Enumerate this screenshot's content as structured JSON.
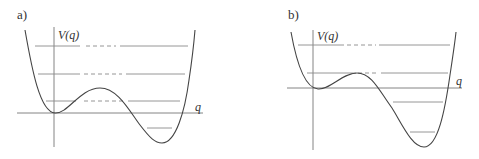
{
  "panels": [
    {
      "label": "a)",
      "y_axis_label": "V(q)",
      "x_axis_label": "q",
      "description": "Asymmetric double-well potential; the right well is deeper. Energy levels shown as horizontal lines, dashed where they pass through the barrier region.",
      "energy_levels": 4
    },
    {
      "label": "b)",
      "y_axis_label": "V(q)",
      "x_axis_label": "q",
      "description": "Strongly asymmetric potential with a shallow metastable left well and a deep right well. Energy levels shown as horizontal lines, dashed across the barrier.",
      "energy_levels": 4
    }
  ],
  "colors": {
    "curve": "#444444",
    "axis": "#777777",
    "level": "#8a8a8a"
  }
}
